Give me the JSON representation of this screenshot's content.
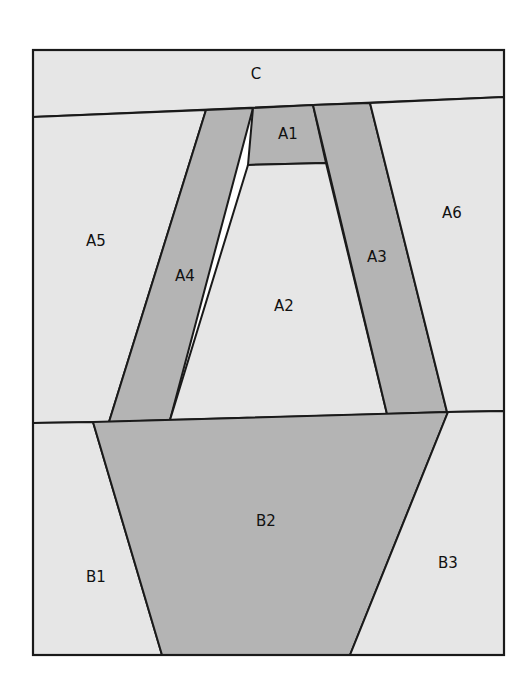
{
  "diagram": {
    "type": "foundation-paper-piecing-pattern",
    "frame": {
      "x": 33,
      "y": 50,
      "width": 471,
      "height": 605
    },
    "colors": {
      "light": "#e6e6e6",
      "dark": "#b4b4b4",
      "line": "#1a1a1a",
      "background": "#ffffff"
    },
    "regions": [
      {
        "id": "C",
        "label": "C",
        "shade": "light",
        "points": "33,50 504,50 504,97 33,117",
        "label_pos": [
          256,
          74
        ]
      },
      {
        "id": "A5",
        "label": "A5",
        "shade": "light",
        "points": "33,117 206,110 109,422 33,423",
        "label_pos": [
          96,
          241
        ]
      },
      {
        "id": "A4",
        "label": "A4",
        "shade": "dark",
        "points": "206,110 253,108 170,420 109,422",
        "label_pos": [
          185,
          276
        ]
      },
      {
        "id": "A1",
        "label": "A1",
        "shade": "dark",
        "points": "253,108 313,105 326,163 248,165",
        "label_pos": [
          288,
          134
        ]
      },
      {
        "id": "A2",
        "label": "A2",
        "shade": "light",
        "points": "248,165 326,163 387,414 170,420",
        "label_pos": [
          284,
          306
        ]
      },
      {
        "id": "A3",
        "label": "A3",
        "shade": "dark",
        "points": "313,105 370,103 447,412 387,414",
        "label_pos": [
          377,
          257
        ]
      },
      {
        "id": "A6",
        "label": "A6",
        "shade": "light",
        "points": "370,103 504,97 504,411 447,412",
        "label_pos": [
          452,
          213
        ]
      },
      {
        "id": "B1",
        "label": "B1",
        "shade": "light",
        "points": "33,423 93,422 162,655 33,655",
        "label_pos": [
          96,
          577
        ]
      },
      {
        "id": "B2",
        "label": "B2",
        "shade": "dark",
        "points": "93,422 448,412 350,655 162,655",
        "label_pos": [
          266,
          521
        ]
      },
      {
        "id": "B3",
        "label": "B3",
        "shade": "light",
        "points": "448,412 504,411 504,655 350,655",
        "label_pos": [
          448,
          563
        ]
      }
    ]
  }
}
